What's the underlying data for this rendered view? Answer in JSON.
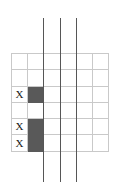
{
  "diagram": {
    "grid": {
      "rows": 6,
      "cols": 6,
      "origin_x": 11,
      "origin_y": 53,
      "cell_width": 16.2,
      "cell_height": 16.3,
      "border_color": "#c9c9c9",
      "cell_background": "#ffffff",
      "filled_color": "#595959",
      "mark_label": "X",
      "cells": [
        [
          {
            "state": "empty",
            "label": ""
          },
          {
            "state": "empty",
            "label": ""
          },
          {
            "state": "empty",
            "label": ""
          },
          {
            "state": "empty",
            "label": ""
          },
          {
            "state": "empty",
            "label": ""
          },
          {
            "state": "empty",
            "label": ""
          }
        ],
        [
          {
            "state": "empty",
            "label": ""
          },
          {
            "state": "empty",
            "label": ""
          },
          {
            "state": "empty",
            "label": ""
          },
          {
            "state": "empty",
            "label": ""
          },
          {
            "state": "empty",
            "label": ""
          },
          {
            "state": "empty",
            "label": ""
          }
        ],
        [
          {
            "state": "marked",
            "label": "X"
          },
          {
            "state": "filled",
            "label": ""
          },
          {
            "state": "empty",
            "label": ""
          },
          {
            "state": "empty",
            "label": ""
          },
          {
            "state": "empty",
            "label": ""
          },
          {
            "state": "empty",
            "label": ""
          }
        ],
        [
          {
            "state": "empty",
            "label": ""
          },
          {
            "state": "empty",
            "label": ""
          },
          {
            "state": "empty",
            "label": ""
          },
          {
            "state": "empty",
            "label": ""
          },
          {
            "state": "empty",
            "label": ""
          },
          {
            "state": "empty",
            "label": ""
          }
        ],
        [
          {
            "state": "marked",
            "label": "X"
          },
          {
            "state": "filled",
            "label": ""
          },
          {
            "state": "empty",
            "label": ""
          },
          {
            "state": "empty",
            "label": ""
          },
          {
            "state": "empty",
            "label": ""
          },
          {
            "state": "empty",
            "label": ""
          }
        ],
        [
          {
            "state": "marked",
            "label": "X"
          },
          {
            "state": "filled",
            "label": ""
          },
          {
            "state": "empty",
            "label": ""
          },
          {
            "state": "empty",
            "label": ""
          },
          {
            "state": "empty",
            "label": ""
          },
          {
            "state": "empty",
            "label": ""
          }
        ]
      ]
    },
    "vertical_lines": {
      "color": "#565656",
      "thickness": 1,
      "top": 18,
      "bottom": 182,
      "positions": [
        43,
        60,
        76
      ]
    }
  }
}
